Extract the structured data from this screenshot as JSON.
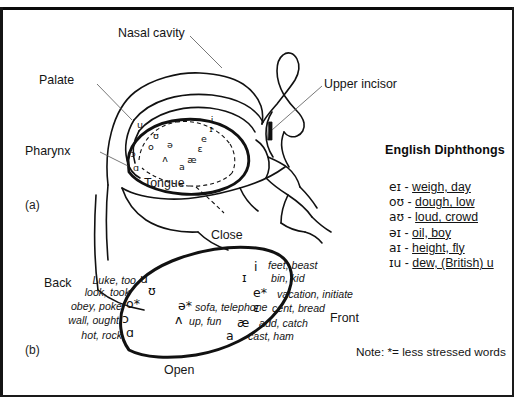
{
  "figure": {
    "panel_a_mark": "(a)",
    "panel_b_mark": "(b)"
  },
  "head_diagram": {
    "labels": {
      "nasal_cavity": "Nasal cavity",
      "palate": "Palate",
      "pharynx": "Pharynx",
      "tongue": "Tongue",
      "upper_incisor": "Upper incisor"
    },
    "tongue_vowel_symbols": [
      "u",
      "ʊ",
      "o",
      "ə",
      "ʌ",
      "ɔ",
      "ɑ",
      "a",
      "æ",
      "ɛ",
      "e",
      "ɪ",
      "i"
    ]
  },
  "diphthongs": {
    "title": "English Diphthongs",
    "items": [
      {
        "symbol": "eɪ",
        "dash": "-",
        "words": "weigh, day"
      },
      {
        "symbol": "oʊ",
        "dash": "-",
        "words": "dough, low"
      },
      {
        "symbol": "aʊ",
        "dash": "-",
        "words": "loud, crowd"
      },
      {
        "symbol": "əɪ",
        "dash": "-",
        "words": "oil, boy"
      },
      {
        "symbol": "aɪ",
        "dash": "-",
        "words": "height, fly"
      },
      {
        "symbol": "ɪu",
        "dash": "-",
        "words": "dew, (British) u"
      }
    ]
  },
  "note": "Note: *= less stressed words",
  "vowel_chart": {
    "axis_labels": {
      "close": "Close",
      "open": "Open",
      "front": "Front",
      "back": "Back"
    },
    "back_vowels": [
      {
        "symbol": "u",
        "words": "Luke, too"
      },
      {
        "symbol": "ʊ",
        "words": "look, took"
      },
      {
        "symbol": "o*",
        "words": "obey, poke"
      },
      {
        "symbol": "ɔ",
        "words": "wall, ought"
      },
      {
        "symbol": "ɑ",
        "words": "hot, rock"
      }
    ],
    "central_vowels": [
      {
        "symbol": "ə*",
        "words": "sofa, telephone"
      },
      {
        "symbol": "ʌ",
        "words": "up, fun"
      }
    ],
    "front_vowels": [
      {
        "symbol": "i",
        "words": "feet, beast"
      },
      {
        "symbol": "ɪ",
        "words": "bin, kid"
      },
      {
        "symbol": "e*",
        "words": "vacation, initiate"
      },
      {
        "symbol": "ɛ",
        "words": "cent, bread"
      },
      {
        "symbol": "æ",
        "words": "add, catch"
      },
      {
        "symbol": "a",
        "words": "cast, ham"
      }
    ]
  },
  "colors": {
    "ink": "#111111",
    "background": "#ffffff"
  }
}
